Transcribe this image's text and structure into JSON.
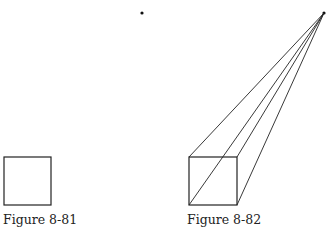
{
  "figures": [
    {
      "caption": "Figure 8-81"
    },
    {
      "caption": "Figure 8-82"
    }
  ],
  "diagram": {
    "stray_dot": [
      142,
      13
    ],
    "vanishing_point": [
      324,
      13
    ],
    "square_1": {
      "x": 4,
      "y": 157,
      "size": 47
    },
    "square_2": {
      "x": 189,
      "y": 157,
      "size": 48
    }
  }
}
